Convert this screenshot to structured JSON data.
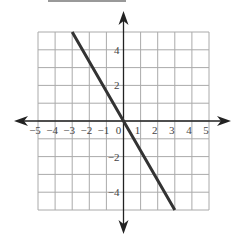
{
  "chart_data": {
    "type": "line",
    "title": "",
    "xlabel": "",
    "ylabel": "",
    "xlim": [
      -5,
      5
    ],
    "ylim": [
      -5,
      5
    ],
    "grid": true,
    "x_ticks": [
      "-5",
      "-4",
      "-3",
      "-2",
      "-1",
      "0",
      "1",
      "2",
      "3",
      "4",
      "5"
    ],
    "y_ticks": [
      "4",
      "2",
      "-2",
      "-4"
    ],
    "series": [
      {
        "name": "line",
        "equation": "y = -5/3 x",
        "x": [
          -3,
          0,
          3
        ],
        "y": [
          5,
          0,
          -5
        ]
      }
    ]
  },
  "colors": {
    "grid": "#aaaaaa",
    "axis": "#222222",
    "line": "#333333"
  }
}
